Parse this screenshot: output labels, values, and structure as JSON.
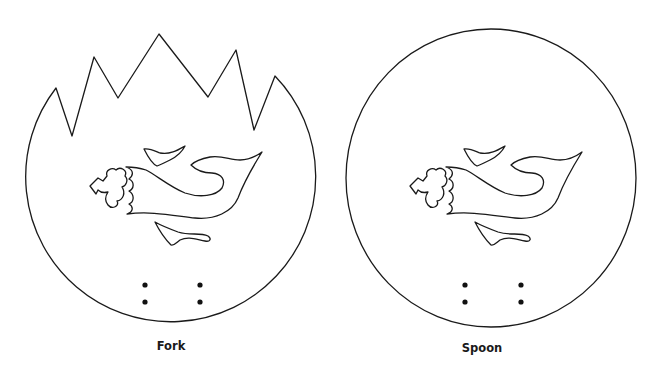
{
  "figure": {
    "panels": [
      {
        "id": "fork",
        "label": "Fork",
        "shape": "circle-with-jagged-top",
        "motif": "fish-icon",
        "holes": 4
      },
      {
        "id": "spoon",
        "label": "Spoon",
        "shape": "circle",
        "motif": "fish-icon",
        "holes": 4
      }
    ],
    "colors": {
      "stroke": "#1a1a1a",
      "background": "#ffffff"
    }
  }
}
